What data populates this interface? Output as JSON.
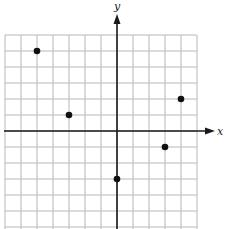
{
  "chart_data": {
    "type": "scatter",
    "title": "",
    "xlabel": "x",
    "ylabel": "y",
    "grid": true,
    "xlim": [
      -7,
      5
    ],
    "ylim": [
      -6,
      6
    ],
    "tick_labels": false,
    "points": [
      {
        "x": -5,
        "y": 5
      },
      {
        "x": -3,
        "y": 1
      },
      {
        "x": 4,
        "y": 2
      },
      {
        "x": 3,
        "y": -1
      },
      {
        "x": 0,
        "y": -3
      }
    ]
  },
  "axes": {
    "x_label": "x",
    "y_label": "y"
  },
  "layout": {
    "origin_px": [
      117,
      131
    ],
    "cell_px": 16,
    "grid_left": 5,
    "grid_right": 197,
    "grid_top": 35,
    "grid_bottom": 229
  }
}
